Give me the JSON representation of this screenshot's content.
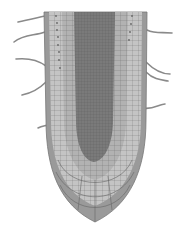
{
  "figure": {
    "colors": {
      "background": "#ffffff",
      "root_cap": "#9a9a9a",
      "cortex_light": "#c4c4c4",
      "cortex_mid": "#aeaeae",
      "stele": "#7a7a7a",
      "cell_walls": "#555555",
      "root_hairs": "#8a8a8a"
    },
    "root_hairs": {
      "left_count": 4,
      "right_count": 4
    }
  }
}
